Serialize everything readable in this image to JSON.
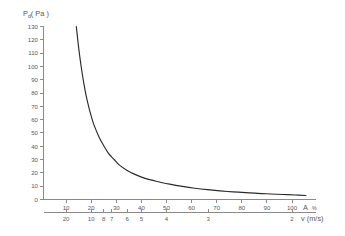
{
  "chart_data": {
    "type": "line",
    "title": "",
    "ylabel": "Pd (Pa)",
    "ylabel_main": "P",
    "ylabel_sub": "d",
    "ylabel_unit": "( Pa )",
    "ylim": [
      0,
      130
    ],
    "yticks": [
      0,
      10,
      20,
      30,
      40,
      50,
      60,
      70,
      80,
      90,
      100,
      110,
      120,
      130
    ],
    "grid": false,
    "legend": null,
    "axes": [
      {
        "id": "primary-x",
        "name": "A %",
        "xlabel": "A %",
        "xlabel_main": "A",
        "xlabel_unit": "%",
        "position": "bottom-upper",
        "scale": "linear",
        "xlim": [
          0,
          108
        ],
        "ticks": [
          10,
          20,
          30,
          40,
          50,
          60,
          70,
          80,
          90,
          100
        ],
        "ticklabels": [
          "10",
          "20",
          "30",
          "40",
          "50",
          "60",
          "70",
          "80",
          "90",
          "100"
        ]
      },
      {
        "id": "secondary-x",
        "name": "v (m/s)",
        "xlabel": "v (m/s)",
        "position": "bottom-lower",
        "scale": "reciprocal",
        "ticks": [
          20,
          10,
          8,
          7,
          6,
          5,
          4,
          3,
          2
        ],
        "ticklabels": [
          "20",
          "10",
          "8",
          "7",
          "6",
          "5",
          "4",
          "3",
          "2"
        ],
        "tick_positions_on_primary": [
          10,
          20,
          25,
          28.5,
          33.3,
          40,
          50,
          66.7,
          100
        ]
      }
    ],
    "series": [
      {
        "name": "dynamic pressure",
        "color": "#2b2b2b",
        "x": [
          13,
          14,
          15,
          16,
          17,
          18,
          19,
          20,
          22,
          24,
          26,
          28,
          30,
          33,
          36,
          40,
          45,
          50,
          55,
          60,
          65,
          70,
          75,
          80,
          85,
          90,
          95,
          100,
          104
        ],
        "y": [
          130,
          113,
          99,
          87,
          77,
          69,
          62,
          56,
          47,
          40,
          34,
          30,
          26,
          22,
          19,
          16,
          13.5,
          11.5,
          9.8,
          8.4,
          7.3,
          6.4,
          5.7,
          5.1,
          4.5,
          4.1,
          3.7,
          3.3,
          2.9
        ]
      }
    ]
  }
}
